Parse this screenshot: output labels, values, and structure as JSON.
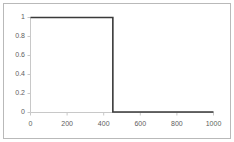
{
  "chart_data": {
    "type": "line",
    "title": "",
    "xlabel": "",
    "ylabel": "",
    "xlim": [
      0,
      1000
    ],
    "ylim": [
      0,
      1
    ],
    "grid": false,
    "legend": null,
    "xticks": [
      0,
      200,
      400,
      600,
      800,
      1000
    ],
    "xtick_labels": [
      "0",
      "200",
      "400",
      "600",
      "800",
      "1000"
    ],
    "yticks": [
      0,
      0.2,
      0.4,
      0.6,
      0.8,
      1
    ],
    "ytick_labels": [
      "0",
      "0.2",
      "0.4",
      "0.6",
      "0.8",
      "1"
    ],
    "series": [
      {
        "name": "step",
        "color": "#3a3a3a",
        "x": [
          0,
          450,
          450,
          1000
        ],
        "values": [
          1,
          1,
          0,
          0
        ]
      }
    ]
  },
  "style": {
    "axis_color": "#c8c8c8",
    "border_color": "#b9b9b9",
    "line_color": "#3a3a3a",
    "tick_text_color": "#5e5e5e",
    "background": "#ffffff"
  }
}
